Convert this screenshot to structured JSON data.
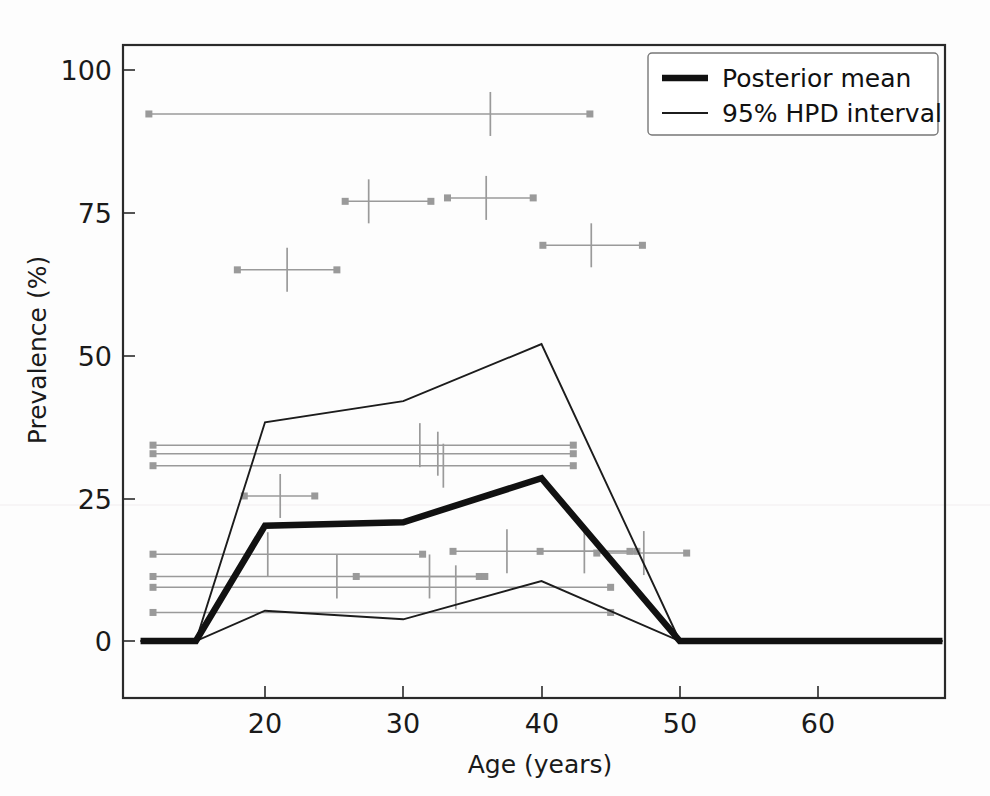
{
  "chart_data": {
    "type": "line",
    "title": "",
    "xlabel": "Age (years)",
    "ylabel": "Prevalence (%)",
    "xlim": [
      11,
      69
    ],
    "ylim": [
      -8,
      108
    ],
    "xticks": [
      20,
      30,
      40,
      50,
      60
    ],
    "xticklabels": [
      "20",
      "30",
      "40",
      "50",
      "60"
    ],
    "yticks": [
      0,
      25,
      50,
      75,
      100
    ],
    "yticklabels": [
      "0",
      "25",
      "50",
      "75",
      "100"
    ],
    "grid": false,
    "legend_position": "upper right",
    "legend": [
      {
        "label": "Posterior mean",
        "style": "thick-black-line"
      },
      {
        "label": "95% HPD interval",
        "style": "thin-black-line"
      }
    ],
    "x": [
      11,
      15,
      20,
      30,
      40,
      50,
      69
    ],
    "series": [
      {
        "name": "Posterior mean",
        "values": [
          0,
          0,
          20.2,
          20.8,
          28.5,
          0,
          0
        ]
      },
      {
        "name": "95% HPD upper",
        "values": [
          0,
          0,
          38.3,
          42.0,
          52.0,
          0,
          0
        ]
      },
      {
        "name": "95% HPD lower",
        "values": [
          0,
          0,
          5.3,
          3.8,
          10.5,
          0,
          0
        ]
      }
    ],
    "observations": [
      {
        "y": 92.3,
        "x_lo": 11.6,
        "x_hi": 43.5,
        "x_mid": 36.3
      },
      {
        "y": 77.0,
        "x_lo": 25.8,
        "x_hi": 32.0,
        "x_mid": 27.5
      },
      {
        "y": 77.6,
        "x_lo": 33.2,
        "x_hi": 39.4,
        "x_mid": 36.0
      },
      {
        "y": 65.0,
        "x_lo": 18.0,
        "x_hi": 25.2,
        "x_mid": 21.6
      },
      {
        "y": 69.3,
        "x_lo": 40.1,
        "x_hi": 47.3,
        "x_mid": 43.6
      },
      {
        "y": 34.3,
        "x_lo": 11.9,
        "x_hi": 42.3,
        "x_mid": 31.2
      },
      {
        "y": 32.8,
        "x_lo": 11.9,
        "x_hi": 42.3,
        "x_mid": 32.5
      },
      {
        "y": 30.7,
        "x_lo": 11.9,
        "x_hi": 42.3,
        "x_mid": 32.9
      },
      {
        "y": 25.4,
        "x_lo": 18.5,
        "x_hi": 23.6,
        "x_mid": 21.1
      },
      {
        "y": 15.2,
        "x_lo": 11.9,
        "x_hi": 31.4,
        "x_mid": 20.2
      },
      {
        "y": 15.7,
        "x_lo": 33.6,
        "x_hi": 46.9,
        "x_mid": 37.5
      },
      {
        "y": 15.7,
        "x_lo": 39.9,
        "x_hi": 46.4,
        "x_mid": 43.1
      },
      {
        "y": 15.4,
        "x_lo": 44.0,
        "x_hi": 50.5,
        "x_mid": 47.4
      },
      {
        "y": 11.3,
        "x_lo": 11.9,
        "x_hi": 35.5,
        "x_mid": 25.2
      },
      {
        "y": 11.3,
        "x_lo": 26.6,
        "x_hi": 35.9,
        "x_mid": 31.9
      },
      {
        "y": 9.4,
        "x_lo": 11.9,
        "x_hi": 45.0,
        "x_mid": 33.8
      },
      {
        "y": 5.0,
        "x_lo": 11.9,
        "x_hi": 45.0,
        "x_mid": null
      }
    ]
  },
  "axes": {
    "y_label": "Prevalence (%)",
    "x_label": "Age (years)"
  },
  "legend": {
    "mean_label": "Posterior mean",
    "hpd_label": "95% HPD interval"
  },
  "ticks": {
    "y": [
      "100",
      "75",
      "50",
      "25",
      "0"
    ],
    "x": [
      "20",
      "30",
      "40",
      "50",
      "60"
    ]
  },
  "colors": {
    "mean": "#111111",
    "hpd": "#1c1c1c",
    "observation": "#9a9a9a",
    "axis": "#2a2a2a",
    "background": "#fdfdfd"
  }
}
